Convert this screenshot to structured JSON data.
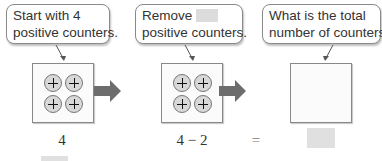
{
  "bubbles": [
    {
      "line1": "Start with 4",
      "line2": "positive counters."
    },
    {
      "line1": "Remove",
      "line1_blank": true,
      "line2": "positive counters."
    },
    {
      "line1": "What is the total",
      "line2": "number of counters?"
    }
  ],
  "boxes": [
    {
      "counters": 4,
      "counter_symbol": "+"
    },
    {
      "counters": 4,
      "counter_symbol": "+"
    },
    {
      "counters": 0
    }
  ],
  "arrows": [
    "right-arrow",
    "right-arrow"
  ],
  "equation": {
    "term1": "4",
    "term2": "4 − 2",
    "equals": "=",
    "answer_blank": true
  },
  "colors": {
    "arrow": "#6d6d6d",
    "blank": "#dcdcdc",
    "counter_fill": "#d8d8d8"
  }
}
